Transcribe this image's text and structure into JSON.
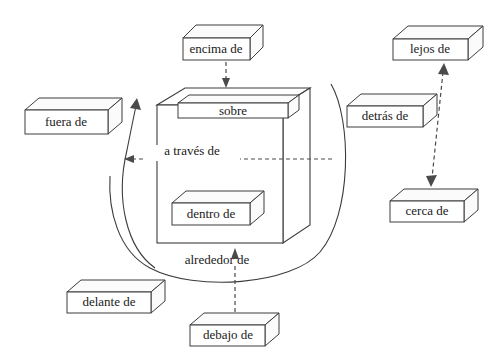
{
  "diagram": {
    "language": "es",
    "style": {
      "background": "#ffffff",
      "line_color": "#3c3c3c",
      "text_color": "#1a1a1a",
      "dash_color": "#4a4a4a"
    },
    "center_object": {
      "name": "cube",
      "label_top": "sobre",
      "label_inside": "dentro de",
      "label_through": "a través de"
    },
    "boxes": [
      {
        "id": "encima-de",
        "label": "encima de"
      },
      {
        "id": "lejos-de",
        "label": "lejos de"
      },
      {
        "id": "fuera-de",
        "label": "fuera de"
      },
      {
        "id": "detras-de",
        "label": "detrás de"
      },
      {
        "id": "sobre",
        "label": "sobre"
      },
      {
        "id": "a-traves-de",
        "label": "a través de"
      },
      {
        "id": "cerca-de",
        "label": "cerca de"
      },
      {
        "id": "dentro-de",
        "label": "dentro de"
      },
      {
        "id": "alrededor-de",
        "label": "alrededor de"
      },
      {
        "id": "delante-de",
        "label": "delante de"
      },
      {
        "id": "debajo-de",
        "label": "debajo de"
      }
    ],
    "connectors": [
      {
        "id": "encima-arrow",
        "from": "encima de",
        "to": "cube-top",
        "type": "dashed-arrow-down"
      },
      {
        "id": "traves-arrow",
        "from": "cube",
        "to": "left",
        "type": "dashed-arrow-left"
      },
      {
        "id": "fuera-arc-arrow",
        "from": "cube-bottom",
        "to": "fuera de",
        "type": "solid-curve-arrow"
      },
      {
        "id": "lejos-cerca-arrow",
        "from": "cerca de",
        "to": "lejos de",
        "type": "dashed-double-arrow"
      },
      {
        "id": "debajo-arrow",
        "from": "debajo de",
        "to": "cube-bottom",
        "type": "dashed-arrow-up"
      },
      {
        "id": "alrededor-circle",
        "from": "cube",
        "to": "cube",
        "type": "solid-arc-around"
      }
    ]
  }
}
